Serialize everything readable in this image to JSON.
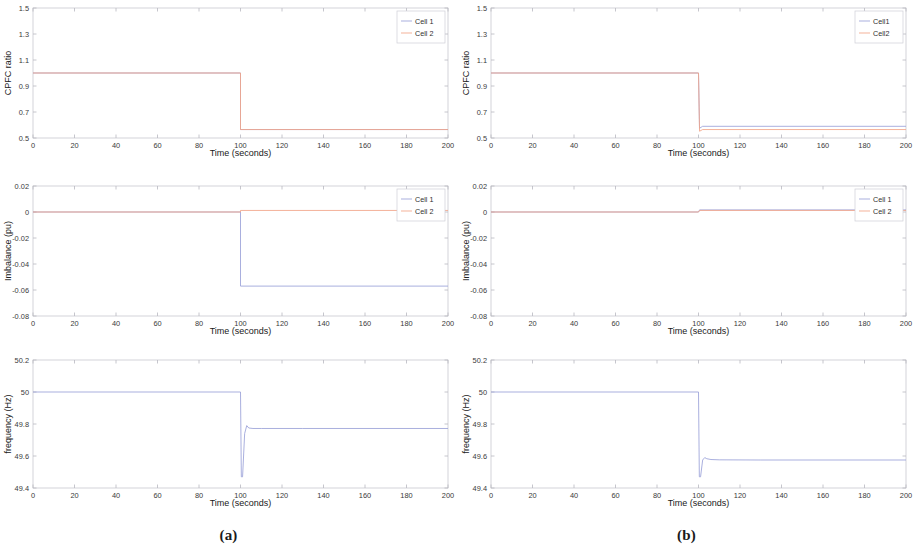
{
  "figure": {
    "width": 915,
    "height": 560,
    "background": "#ffffff",
    "subpanels": [
      {
        "id": "a",
        "caption": "(a)"
      },
      {
        "id": "b",
        "caption": "(b)"
      }
    ]
  },
  "colors": {
    "cell1": "#9aa0d8",
    "cell2": "#f2a488",
    "axis": "#c9c9cf",
    "text": "#2e2e2e"
  },
  "axis_common": {
    "xlabel": "Time (seconds)",
    "xlim": [
      0,
      200
    ],
    "xticks": [
      0,
      20,
      40,
      60,
      80,
      100,
      120,
      140,
      160,
      180,
      200
    ],
    "xticklabels": [
      "0",
      "20",
      "40",
      "60",
      "80",
      "100",
      "120",
      "140",
      "160",
      "180",
      "200"
    ]
  },
  "chart_data": [
    {
      "id": "a-cpfc",
      "panel": "(a)",
      "type": "line",
      "title": "",
      "xlabel": "Time (seconds)",
      "ylabel": "CPFC ratio",
      "xlim": [
        0,
        200
      ],
      "ylim": [
        0.5,
        1.5
      ],
      "xticks": [
        0,
        20,
        40,
        60,
        80,
        100,
        120,
        140,
        160,
        180,
        200
      ],
      "yticks": [
        0.5,
        0.7,
        0.9,
        1.1,
        1.3,
        1.5
      ],
      "yticklabels": [
        "0.5",
        "0.7",
        "0.9",
        "1.1",
        "1.3",
        "1.5"
      ],
      "grid": false,
      "legend": {
        "position": "top-right",
        "entries": [
          "Cell 1",
          "Cell 2"
        ]
      },
      "series": [
        {
          "name": "Cell 1",
          "color": "#9aa0d8",
          "x": [
            0,
            100,
            100,
            200
          ],
          "y": [
            1.0,
            1.0,
            0.565,
            0.565
          ]
        },
        {
          "name": "Cell 2",
          "color": "#f2a488",
          "x": [
            0,
            100,
            100,
            200
          ],
          "y": [
            1.0,
            1.0,
            0.565,
            0.565
          ]
        }
      ]
    },
    {
      "id": "a-imbalance",
      "panel": "(a)",
      "type": "line",
      "title": "",
      "xlabel": "Time (seconds)",
      "ylabel": "Imbalance (pu)",
      "xlim": [
        0,
        200
      ],
      "ylim": [
        -0.08,
        0.02
      ],
      "xticks": [
        0,
        20,
        40,
        60,
        80,
        100,
        120,
        140,
        160,
        180,
        200
      ],
      "yticks": [
        -0.08,
        -0.06,
        -0.04,
        -0.02,
        0,
        0.02
      ],
      "yticklabels": [
        "-0.08",
        "-0.06",
        "-0.04",
        "-0.02",
        "0",
        "0.02"
      ],
      "grid": false,
      "legend": {
        "position": "top-right",
        "entries": [
          "Cell 1",
          "Cell 2"
        ]
      },
      "series": [
        {
          "name": "Cell 1",
          "color": "#9aa0d8",
          "x": [
            0,
            100,
            100,
            200
          ],
          "y": [
            0.0,
            0.0,
            -0.057,
            -0.057
          ]
        },
        {
          "name": "Cell 2",
          "color": "#f2a488",
          "x": [
            0,
            100,
            100,
            200
          ],
          "y": [
            0.0,
            0.0,
            0.0012,
            0.0012
          ]
        }
      ]
    },
    {
      "id": "a-frequency",
      "panel": "(a)",
      "type": "line",
      "title": "",
      "xlabel": "Time (seconds)",
      "ylabel": "frequency (Hz)",
      "xlim": [
        0,
        200
      ],
      "ylim": [
        49.4,
        50.2
      ],
      "xticks": [
        0,
        20,
        40,
        60,
        80,
        100,
        120,
        140,
        160,
        180,
        200
      ],
      "yticks": [
        49.4,
        49.6,
        49.8,
        50,
        50.2
      ],
      "yticklabels": [
        "49.4",
        "49.6",
        "49.8",
        "50",
        "50.2"
      ],
      "grid": false,
      "legend": null,
      "series": [
        {
          "name": "frequency",
          "color": "#9aa0d8",
          "x": [
            0,
            100,
            100.4,
            101,
            102,
            103,
            104,
            106,
            110,
            130,
            200
          ],
          "y": [
            50.0,
            50.0,
            49.47,
            49.47,
            49.74,
            49.79,
            49.775,
            49.772,
            49.772,
            49.772,
            49.772
          ]
        }
      ]
    },
    {
      "id": "b-cpfc",
      "panel": "(b)",
      "type": "line",
      "title": "",
      "xlabel": "Time (seconds)",
      "ylabel": "CPFC ratio",
      "xlim": [
        0,
        200
      ],
      "ylim": [
        0.5,
        1.5
      ],
      "xticks": [
        0,
        20,
        40,
        60,
        80,
        100,
        120,
        140,
        160,
        180,
        200
      ],
      "yticks": [
        0.5,
        0.7,
        0.9,
        1.1,
        1.3,
        1.5
      ],
      "yticklabels": [
        "0.5",
        "0.7",
        "0.9",
        "1.1",
        "1.3",
        "1.5"
      ],
      "grid": false,
      "legend": {
        "position": "top-right",
        "entries": [
          "Cell1",
          "Cell2"
        ]
      },
      "series": [
        {
          "name": "Cell1",
          "color": "#9aa0d8",
          "x": [
            0,
            100,
            100.5,
            102,
            200
          ],
          "y": [
            1.0,
            1.0,
            0.575,
            0.59,
            0.59
          ]
        },
        {
          "name": "Cell2",
          "color": "#f2a488",
          "x": [
            0,
            100,
            100.5,
            102,
            200
          ],
          "y": [
            1.0,
            1.0,
            0.552,
            0.565,
            0.565
          ]
        }
      ]
    },
    {
      "id": "b-imbalance",
      "panel": "(b)",
      "type": "line",
      "title": "",
      "xlabel": "Time (seconds)",
      "ylabel": "Imbalance (pu)",
      "xlim": [
        0,
        200
      ],
      "ylim": [
        -0.08,
        0.02
      ],
      "xticks": [
        0,
        20,
        40,
        60,
        80,
        100,
        120,
        140,
        160,
        180,
        200
      ],
      "yticks": [
        -0.08,
        -0.06,
        -0.04,
        -0.02,
        0,
        0.02
      ],
      "yticklabels": [
        "-0.08",
        "-0.06",
        "-0.04",
        "-0.02",
        "0",
        "0.02"
      ],
      "grid": false,
      "legend": {
        "position": "top-right",
        "entries": [
          "Cell 1",
          "Cell 2"
        ]
      },
      "series": [
        {
          "name": "Cell 1",
          "color": "#9aa0d8",
          "x": [
            0,
            100,
            100.5,
            200
          ],
          "y": [
            0.0,
            0.0,
            0.0016,
            0.0016
          ]
        },
        {
          "name": "Cell 2",
          "color": "#f2a488",
          "x": [
            0,
            100,
            100.5,
            200
          ],
          "y": [
            0.0,
            0.0,
            0.0012,
            0.0012
          ]
        }
      ]
    },
    {
      "id": "b-frequency",
      "panel": "(b)",
      "type": "line",
      "title": "",
      "xlabel": "Time (seconds)",
      "ylabel": "frequency (Hz)",
      "xlim": [
        0,
        200
      ],
      "ylim": [
        49.4,
        50.2
      ],
      "xticks": [
        0,
        20,
        40,
        60,
        80,
        100,
        120,
        140,
        160,
        180,
        200
      ],
      "yticks": [
        49.4,
        49.6,
        49.8,
        50,
        50.2
      ],
      "yticklabels": [
        "49.4",
        "49.6",
        "49.8",
        "50",
        "50.2"
      ],
      "grid": false,
      "legend": null,
      "series": [
        {
          "name": "frequency",
          "color": "#9aa0d8",
          "x": [
            0,
            100,
            100.4,
            101,
            102,
            103,
            104,
            106,
            110,
            130,
            200
          ],
          "y": [
            50.0,
            50.0,
            49.47,
            49.47,
            49.575,
            49.59,
            49.583,
            49.578,
            49.576,
            49.575,
            49.575
          ]
        }
      ]
    }
  ]
}
